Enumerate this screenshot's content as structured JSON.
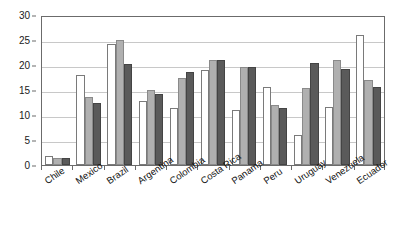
{
  "chart_data": {
    "type": "bar",
    "title": "",
    "subtitle": "",
    "xlabel": "",
    "ylabel": "",
    "ylim": [
      0,
      30
    ],
    "yticks": [
      0,
      5,
      10,
      15,
      20,
      25,
      30
    ],
    "grid": true,
    "legend": "none",
    "orientation": "vertical",
    "grouping": "clustered",
    "categories": [
      "Chile",
      "Mexico",
      "Brazil",
      "Argentina",
      "Colombia",
      "Costa Rica",
      "Panama",
      "Peru",
      "Uruguay",
      "Venezuela",
      "Ecuador"
    ],
    "series": [
      {
        "name": "series-1",
        "color": "#ffffff",
        "values": [
          1.8,
          18.0,
          24.3,
          12.9,
          11.4,
          19.0,
          11.0,
          15.7,
          6.0,
          11.7,
          26.0
        ]
      },
      {
        "name": "series-2",
        "color": "#b0b0b0",
        "values": [
          1.5,
          13.7,
          25.1,
          15.1,
          17.5,
          21.0,
          19.6,
          12.0,
          15.4,
          21.0,
          17.0
        ]
      },
      {
        "name": "series-3",
        "color": "#5a5a5a",
        "values": [
          1.4,
          12.4,
          20.3,
          14.3,
          18.6,
          21.0,
          19.6,
          11.4,
          20.4,
          19.2,
          15.7
        ]
      }
    ]
  },
  "axis": {
    "y_tick_labels": [
      "0",
      "5",
      "10",
      "15",
      "20",
      "25",
      "30"
    ]
  },
  "colors": {
    "axis": "#6b6b6b",
    "grid": "#c8c8c8",
    "text": "#111111",
    "series1": "#ffffff",
    "series2": "#b0b0b0",
    "series3": "#5a5a5a",
    "background": "#ffffff"
  }
}
